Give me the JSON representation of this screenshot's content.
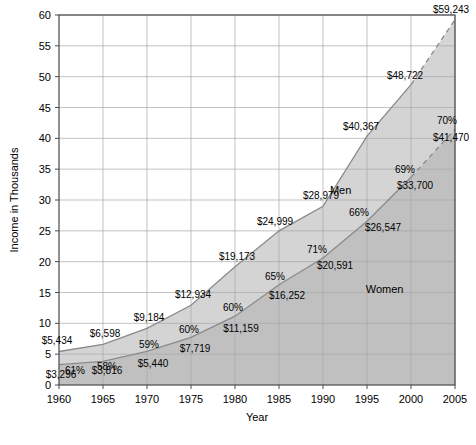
{
  "chart_data": {
    "type": "area",
    "title": "",
    "xlabel": "Year",
    "ylabel": "Income in Thousands",
    "xlim": [
      1960,
      2005
    ],
    "ylim": [
      0,
      60
    ],
    "grid": true,
    "legend_position": "inline-annotation",
    "x": [
      1960,
      1965,
      1970,
      1975,
      1980,
      1985,
      1990,
      1995,
      2000,
      2005
    ],
    "xticks": [
      "1960",
      "1965",
      "1970",
      "1975",
      "1980",
      "1985",
      "1990",
      "1995",
      "2000",
      "2005"
    ],
    "yticks": [
      "0",
      "5",
      "10",
      "15",
      "20",
      "25",
      "30",
      "35",
      "40",
      "45",
      "50",
      "55",
      "60"
    ],
    "series": [
      {
        "name": "Men",
        "values": [
          5434,
          6598,
          9184,
          12934,
          19173,
          24999,
          28979,
          40367,
          48722,
          59243
        ],
        "labels": [
          "$5,434",
          "$6,598",
          "$9,184",
          "$12,934",
          "$19,173",
          "$24,999",
          "$28,979",
          "$40,367",
          "$48,722",
          "$59,243"
        ],
        "fill_color": "#d4d4d4",
        "line_color": "#8a8a8a",
        "dashed_from": 2000
      },
      {
        "name": "Women",
        "values": [
          3296,
          3816,
          5440,
          7719,
          11159,
          16252,
          20591,
          26547,
          33700,
          41470
        ],
        "labels": [
          "$3,296",
          "$3,816",
          "$5,440",
          "$7,719",
          "$11,159",
          "$16,252",
          "$20,591",
          "$26,547",
          "$33,700",
          "$41,470"
        ],
        "fill_color": "#c0c0c0",
        "line_color": "#8a8a8a",
        "dashed_from": 2000
      }
    ],
    "ratio_annotations": {
      "description": "Women's income as a percentage of men's income",
      "values": [
        "61%",
        "58%",
        "59%",
        "60%",
        "60%",
        "65%",
        "71%",
        "66%",
        "69%",
        "70%"
      ]
    },
    "series_inline_labels": [
      {
        "text": "Men",
        "x": 1992,
        "y": 31
      },
      {
        "text": "Women",
        "x": 1997,
        "y": 15
      }
    ]
  }
}
